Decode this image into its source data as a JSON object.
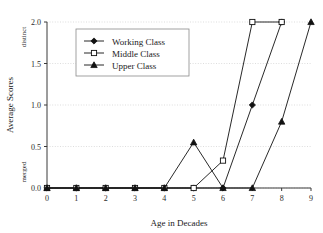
{
  "chart_data": {
    "type": "line",
    "title": "",
    "xlabel": "Age in Decades",
    "ylabel": "Average Scores",
    "x": [
      0,
      1,
      2,
      3,
      4,
      5,
      6,
      7,
      8,
      9
    ],
    "xticklabels": [
      "0",
      "1",
      "2",
      "3",
      "4",
      "5",
      "6",
      "7",
      "8",
      "9"
    ],
    "yticklabels": [
      "0.0",
      "0.5",
      "1.0",
      "1.5",
      "2.0"
    ],
    "ytickvalues": [
      0.0,
      0.5,
      1.0,
      1.5,
      2.0
    ],
    "xlim": [
      0,
      9
    ],
    "ylim": [
      0,
      2
    ],
    "grid": "horizontal-dotted",
    "legend_position": "upper-left-inside",
    "y_endpoint_labels": {
      "low": "merged",
      "high": "distinct"
    },
    "series": [
      {
        "name": "Working Class",
        "marker": "filled-diamond",
        "x": [
          0,
          1,
          2,
          3,
          4,
          5,
          6,
          7,
          8
        ],
        "values": [
          0.0,
          0.0,
          0.0,
          0.0,
          0.0,
          0.0,
          0.0,
          1.0,
          2.0
        ]
      },
      {
        "name": "Middle Class",
        "marker": "open-square",
        "x": [
          0,
          1,
          2,
          3,
          4,
          5,
          6,
          7,
          8
        ],
        "values": [
          0.0,
          0.0,
          0.0,
          0.0,
          0.0,
          0.0,
          0.33,
          2.0,
          2.0
        ]
      },
      {
        "name": "Upper Class",
        "marker": "filled-triangle",
        "x": [
          0,
          1,
          2,
          3,
          4,
          5,
          6,
          7,
          8,
          9
        ],
        "values": [
          0.0,
          0.0,
          0.0,
          0.0,
          0.0,
          0.55,
          0.0,
          0.0,
          0.8,
          2.0
        ]
      }
    ]
  },
  "legend": {
    "entries": [
      {
        "label": "Working Class"
      },
      {
        "label": "Middle Class"
      },
      {
        "label": "Upper Class"
      }
    ]
  }
}
